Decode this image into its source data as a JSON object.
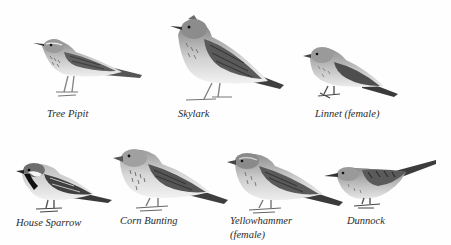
{
  "figure": {
    "title": "",
    "background": "#ffffff",
    "ink_color": "#2a2a2a",
    "rows": [
      {
        "birds": [
          {
            "id": "tree-pipit",
            "label": "Tree Pipit"
          },
          {
            "id": "skylark",
            "label": "Skylark"
          },
          {
            "id": "linnet-female",
            "label": "Linnet (female)"
          }
        ]
      },
      {
        "birds": [
          {
            "id": "house-sparrow",
            "label": "House Sparrow"
          },
          {
            "id": "corn-bunting",
            "label": "Corn Bunting"
          },
          {
            "id": "yellowhammer-female",
            "label_line1": "Yellowhammer",
            "label_line2": "(female)"
          },
          {
            "id": "dunnock",
            "label": "Dunnock"
          }
        ]
      }
    ]
  }
}
